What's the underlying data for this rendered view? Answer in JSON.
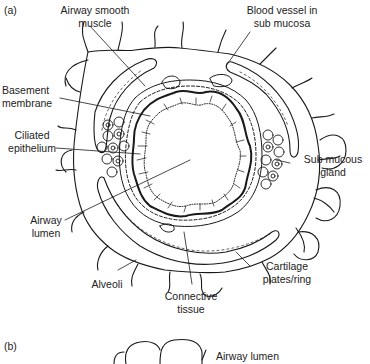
{
  "figure": {
    "panel_a": {
      "tag": "(a)",
      "title": "Cross-section of an airway",
      "labels": {
        "smooth_muscle_1": "Airway smooth",
        "smooth_muscle_2": "muscle",
        "blood_vessel_1": "Blood vessel in",
        "blood_vessel_2": "sub mucosa",
        "basement_1": "Basement",
        "basement_2": "membrane",
        "ciliated_1": "Ciliated",
        "ciliated_2": "epithelium",
        "gland_1": "Sub mucous",
        "gland_2": "gland",
        "lumen_1": "Airway",
        "lumen_2": "lumen",
        "alveoli": "Alveoli",
        "cartilage_1": "Cartilage",
        "cartilage_2": "plates/ring",
        "connective_1": "Connective",
        "connective_2": "tissue"
      }
    },
    "panel_b": {
      "tag": "(b)",
      "labels": {
        "lumen": "Airway lumen"
      }
    }
  },
  "colors": {
    "ink": "#1a1a1a",
    "background": "#ffffff"
  }
}
